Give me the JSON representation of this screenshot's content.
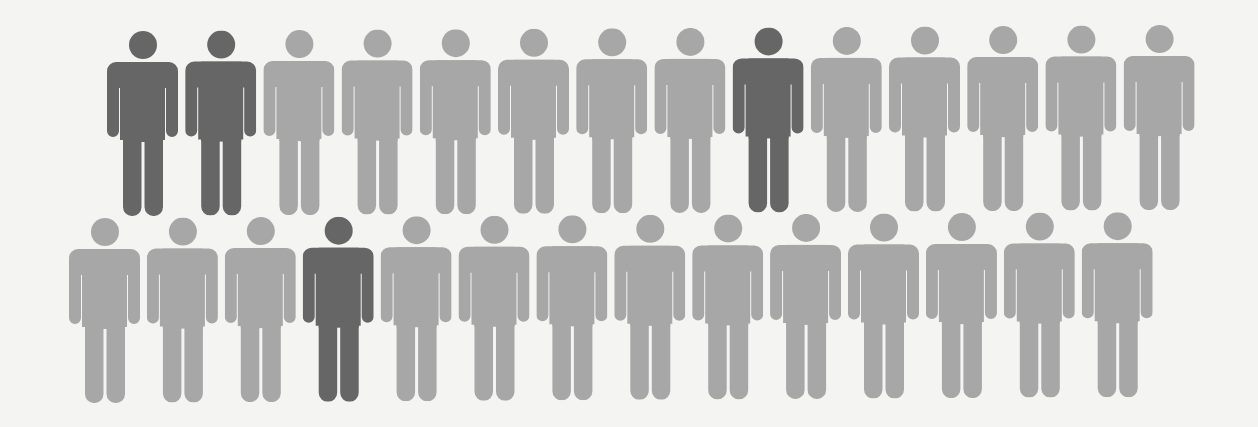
{
  "colors": {
    "highlight": "#666666",
    "base": "#a7a7a7",
    "background": "#f4f4f3"
  },
  "chart_data": {
    "type": "pictogram",
    "title": "",
    "unit": "person",
    "total": 28,
    "highlighted": 4,
    "rows": [
      {
        "row": 1,
        "count": 14,
        "highlighted_positions": [
          1,
          2,
          9
        ],
        "cells": [
          "dark",
          "dark",
          "light",
          "light",
          "light",
          "light",
          "light",
          "light",
          "dark",
          "light",
          "light",
          "light",
          "light",
          "light"
        ]
      },
      {
        "row": 2,
        "count": 14,
        "highlighted_positions": [
          4
        ],
        "cells": [
          "light",
          "light",
          "light",
          "dark",
          "light",
          "light",
          "light",
          "light",
          "light",
          "light",
          "light",
          "light",
          "light",
          "light"
        ]
      }
    ],
    "legend": [],
    "annotations": []
  },
  "layout": {
    "rows": [
      {
        "x0": 107,
        "dx": 78.2,
        "y0": 31,
        "dy": -0.45
      },
      {
        "x0": 69,
        "dx": 77.9,
        "y0": 218,
        "dy": -0.45
      }
    ]
  }
}
